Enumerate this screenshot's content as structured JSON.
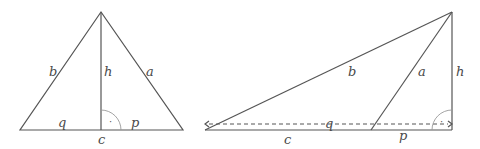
{
  "figures": [
    {
      "name": "acute-triangle",
      "labels": {
        "b": "b",
        "h": "h",
        "a": "a",
        "q": "q",
        "p": "p",
        "c": "c"
      },
      "right_angle_marker": "·"
    },
    {
      "name": "obtuse-triangle",
      "labels": {
        "b": "b",
        "a": "a",
        "h": "h",
        "q": "q",
        "c": "c",
        "p": "p"
      },
      "right_angle_marker": "·"
    }
  ],
  "colors": {
    "line": "#555555",
    "text": "#4a4a4a",
    "arc": "#9a9a9a"
  }
}
